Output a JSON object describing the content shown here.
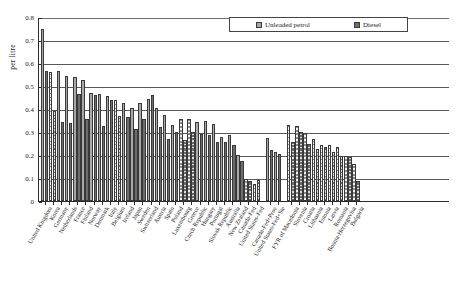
{
  "chart_data": {
    "type": "bar",
    "title": "",
    "xlabel": "",
    "ylabel": "per litre",
    "ylim": [
      0,
      0.8
    ],
    "ytick_labels": [
      "0",
      "0.1",
      "0.2",
      "0.3",
      "0.4",
      "0.5",
      "0.6",
      "0.7",
      "0.8"
    ],
    "ytick_values": [
      0,
      0.1,
      0.2,
      0.3,
      0.4,
      0.5,
      0.6,
      0.7,
      0.8
    ],
    "grid": true,
    "legend_position": "top-right",
    "legend": [
      "Unleaded petrol",
      "Diesel"
    ],
    "categories": [
      "United Kingdom",
      "Korea",
      "Germany",
      "Netherlands",
      "France",
      "Finland",
      "Norway",
      "Denmark",
      "Italy",
      "Belgium",
      "Ireland",
      "Japan",
      "Sweden",
      "Switzerland",
      "Austria",
      "Spain",
      "Poland",
      "Luxembourg",
      "Greece",
      "Czech Republic",
      "Hungary",
      "Portugal",
      "Slovak Republic",
      "Australia",
      "New Zealand",
      "Canada-Fed",
      "United States-Fed",
      "Canada-Fed+Prov",
      "United States-Fed+Ste",
      "FYR of Macedonia",
      "Slovenia",
      "Croatia",
      "Lithuania",
      "Estonia",
      "Latvia",
      "Romania",
      "Bosnia-Herzegovina",
      "Bulgaria"
    ],
    "group_breaks": [
      27,
      29
    ],
    "series": [
      {
        "name": "Unleaded petrol",
        "values": [
          0.75,
          0.56,
          0.565,
          0.545,
          0.54,
          0.525,
          0.47,
          0.465,
          0.455,
          0.44,
          0.425,
          0.405,
          0.425,
          0.445,
          0.405,
          0.375,
          0.33,
          0.355,
          0.355,
          0.345,
          0.35,
          0.335,
          0.28,
          0.285,
          0.2,
          0.095,
          0.075,
          0.275,
          0.215,
          0.33,
          0.325,
          0.295,
          0.27,
          0.245,
          0.245,
          0.235,
          0.195,
          0.16
        ]
      },
      {
        "name": "Diesel",
        "values": [
          0.565,
          0.39,
          0.345,
          0.34,
          0.465,
          0.355,
          0.46,
          0.325,
          0.44,
          0.37,
          0.365,
          0.315,
          0.355,
          0.46,
          0.32,
          0.27,
          0.3,
          0.265,
          0.3,
          0.29,
          0.285,
          0.255,
          0.255,
          0.245,
          0.175,
          0.085,
          0.09,
          0.22,
          0.205,
          0.255,
          0.3,
          0.25,
          0.225,
          0.235,
          0.215,
          0.195,
          0.19,
          0.085
        ]
      }
    ],
    "series_styles": [
      {
        "name": "Unleaded petrol",
        "fill": "solid-light",
        "color": "#a8a8a8"
      },
      {
        "name": "Diesel",
        "fill": "solid-dark",
        "color": "#6e6e6e"
      }
    ],
    "hatched_categories": [
      "Korea",
      "Belgium",
      "Luxembourg",
      "Greece",
      "Canada-Fed",
      "United States-Fed",
      "FYR of Macedonia",
      "Slovenia",
      "Croatia",
      "Lithuania",
      "Estonia",
      "Latvia",
      "Romania",
      "Bosnia-Herzegovina",
      "Bulgaria"
    ]
  }
}
